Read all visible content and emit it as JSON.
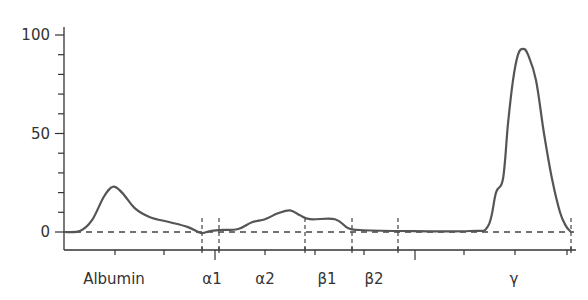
{
  "chart_data": {
    "type": "line",
    "title": "",
    "xlabel": "",
    "ylabel": "",
    "ylim": [
      0,
      100
    ],
    "y_ticks": [
      {
        "value": 0,
        "label": "0"
      },
      {
        "value": 50,
        "label": "50"
      },
      {
        "value": 100,
        "label": "100"
      }
    ],
    "y_minor_tick_step": 10,
    "grid": false,
    "legend": null,
    "baseline_dashed": true,
    "categories": [
      {
        "label": "Albumin",
        "x_px": 114
      },
      {
        "label": "α1",
        "x_px": 212
      },
      {
        "label": "α2",
        "x_px": 265
      },
      {
        "label": "β1",
        "x_px": 327
      },
      {
        "label": "β2",
        "x_px": 374
      },
      {
        "label": "γ",
        "x_px": 514
      }
    ],
    "fraction_dividers_x_px": [
      202,
      219,
      305,
      352,
      398,
      571
    ],
    "series": [
      {
        "name": "Serum protein electrophoresis",
        "points": [
          {
            "x": 64,
            "y": 0
          },
          {
            "x": 80,
            "y": 0.5
          },
          {
            "x": 92,
            "y": 6
          },
          {
            "x": 104,
            "y": 18
          },
          {
            "x": 113,
            "y": 23
          },
          {
            "x": 122,
            "y": 20
          },
          {
            "x": 135,
            "y": 12
          },
          {
            "x": 150,
            "y": 7.5
          },
          {
            "x": 170,
            "y": 5
          },
          {
            "x": 188,
            "y": 2.5
          },
          {
            "x": 201,
            "y": -0.5
          },
          {
            "x": 210,
            "y": 0.5
          },
          {
            "x": 220,
            "y": 1
          },
          {
            "x": 238,
            "y": 1.5
          },
          {
            "x": 252,
            "y": 5
          },
          {
            "x": 265,
            "y": 6.5
          },
          {
            "x": 278,
            "y": 9.5
          },
          {
            "x": 290,
            "y": 11
          },
          {
            "x": 300,
            "y": 8.5
          },
          {
            "x": 310,
            "y": 6.5
          },
          {
            "x": 335,
            "y": 6.5
          },
          {
            "x": 348,
            "y": 2
          },
          {
            "x": 360,
            "y": 1
          },
          {
            "x": 400,
            "y": 0.5
          },
          {
            "x": 470,
            "y": 0.5
          },
          {
            "x": 488,
            "y": 3
          },
          {
            "x": 496,
            "y": 20
          },
          {
            "x": 503,
            "y": 27
          },
          {
            "x": 508,
            "y": 55
          },
          {
            "x": 513,
            "y": 77
          },
          {
            "x": 518,
            "y": 90
          },
          {
            "x": 523,
            "y": 93
          },
          {
            "x": 528,
            "y": 90
          },
          {
            "x": 536,
            "y": 77
          },
          {
            "x": 544,
            "y": 50
          },
          {
            "x": 552,
            "y": 27
          },
          {
            "x": 560,
            "y": 10
          },
          {
            "x": 566,
            "y": 3
          },
          {
            "x": 571,
            "y": 0
          }
        ]
      }
    ],
    "annotations": []
  },
  "colors": {
    "curve": "#555555",
    "axis": "#333333",
    "dashed": "#444444",
    "text": "#333333"
  }
}
